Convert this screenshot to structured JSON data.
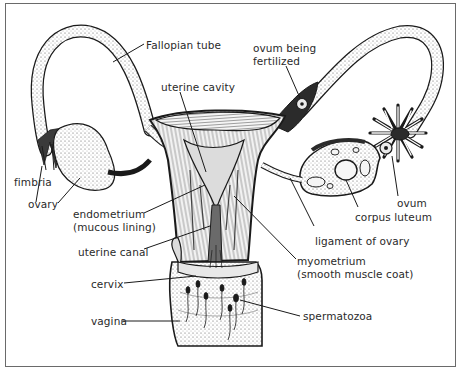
{
  "diagram": {
    "colors": {
      "ink": "#1a1a1a",
      "border": "#6a6a6a",
      "tissue_shade": "#bdbdbd",
      "background": "#ffffff"
    },
    "labels": {
      "fallopian_tube": "Fallopian tube",
      "uterine_cavity": "uterine cavity",
      "ovum_being_fertilized_1": "ovum being",
      "ovum_being_fertilized_2": "fertilized",
      "fimbria": "fimbria",
      "ovary": "ovary",
      "ovum": "ovum",
      "corpus_luteum": "corpus luteum",
      "endometrium_1": "endometrium",
      "endometrium_2": "(mucous lining)",
      "ligament_of_ovary": "ligament of ovary",
      "uterine_canal": "uterine canal",
      "myometrium_1": "myometrium",
      "myometrium_2": "(smooth muscle coat)",
      "cervix": "cervix",
      "spermatozoa": "spermatozoa",
      "vagina": "vagina"
    }
  }
}
